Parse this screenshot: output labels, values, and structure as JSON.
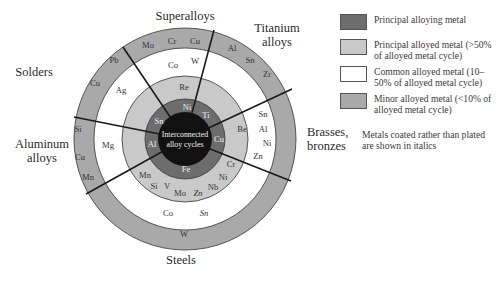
{
  "diagram": {
    "title": "",
    "center_label": [
      "Interconnected",
      "alloy cycles"
    ],
    "colors": {
      "center": "#111111",
      "principal_alloying": "#6d6d6d",
      "principal_alloyed": "#c9c9c9",
      "common_alloyed": "#ffffff",
      "minor_alloyed": "#a9a9a9",
      "lines": "#1a1a1a"
    },
    "categories": [
      {
        "name": "Superalloys",
        "lines": [
          "Superalloys"
        ]
      },
      {
        "name": "Titanium alloys",
        "lines": [
          "Titanium",
          "alloys"
        ]
      },
      {
        "name": "Brasses, bronzes",
        "lines": [
          "Brasses,",
          "bronzes"
        ]
      },
      {
        "name": "Steels",
        "lines": [
          "Steels"
        ]
      },
      {
        "name": "Aluminum alloys",
        "lines": [
          "Aluminum",
          "alloys"
        ]
      },
      {
        "name": "Solders",
        "lines": [
          "Solders"
        ]
      }
    ],
    "segments": {
      "superalloys": {
        "principal_alloying": [
          "Ni"
        ],
        "principal_alloyed": [
          "Re"
        ],
        "common_alloyed": [
          "Co",
          "W"
        ],
        "minor_alloyed": [
          "Mo",
          "Cr",
          "Cu"
        ]
      },
      "titanium_alloys": {
        "principal_alloying": [
          "Ti"
        ],
        "principal_alloyed": [],
        "common_alloyed": [],
        "minor_alloyed": [
          "Al",
          "Sn",
          "Zr"
        ]
      },
      "brasses_bronzes": {
        "principal_alloying": [
          "Cu"
        ],
        "principal_alloyed": [
          "Be"
        ],
        "common_alloyed": [
          "Sn",
          "Al",
          "Ni",
          "Zn"
        ],
        "minor_alloyed": []
      },
      "steels": {
        "principal_alloying": [
          "Fe"
        ],
        "principal_alloyed": [
          "Cr",
          "Ni",
          "Nb",
          "Mn",
          "Si",
          "V",
          "Mo",
          "Zn"
        ],
        "principal_alloyed_italic": [
          "Zn"
        ],
        "common_alloyed": [
          "Co",
          "Sn"
        ],
        "common_alloyed_italic": [
          "Sn"
        ],
        "minor_alloyed": [
          "W"
        ]
      },
      "aluminum_alloys": {
        "principal_alloying": [
          "Al"
        ],
        "principal_alloyed": [],
        "common_alloyed": [
          "Mg"
        ],
        "minor_alloyed": [
          "Si",
          "Cu",
          "Mn"
        ]
      },
      "solders": {
        "principal_alloying": [
          "Sn"
        ],
        "principal_alloyed": [],
        "common_alloyed": [
          "Ag"
        ],
        "minor_alloyed": [
          "Pb",
          "Cu"
        ]
      }
    }
  },
  "legend": {
    "items": [
      {
        "label": "Principal alloying metal",
        "color": "#6d6d6d"
      },
      {
        "label": "Principal alloyed metal (>50% of alloyed metal cycle)",
        "color": "#c9c9c9"
      },
      {
        "label": "Common alloyed metal (10–50% of alloyed metal cycle)",
        "color": "#ffffff"
      },
      {
        "label": "Minor alloyed metal (<10% of alloyed metal cycle)",
        "color": "#a9a9a9"
      }
    ],
    "note": "Metals coated rather than plated are shown in italics"
  }
}
